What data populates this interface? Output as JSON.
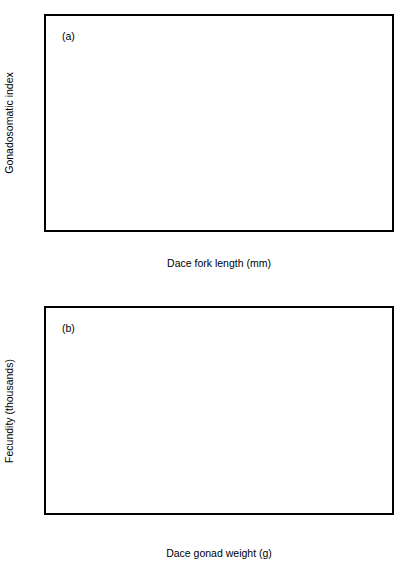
{
  "figure": {
    "background": "#ffffff",
    "foreground": "#000000",
    "marker_color": "#000000",
    "marker_symbol": "triangle-up",
    "panel_count": 2
  },
  "chart_data": [
    {
      "type": "scatter",
      "panel_label": "(a)",
      "title": "",
      "xlabel": "Dace fork length (mm)",
      "ylabel": "Gonadosomatic index",
      "xlim": [
        150,
        250
      ],
      "ylim": [
        0,
        0.4
      ],
      "xticks": [
        150,
        170,
        190,
        210,
        230,
        250
      ],
      "xticklabels": [
        "150",
        "170",
        "190",
        "210",
        "230",
        "250"
      ],
      "yticks": [
        0,
        0.1,
        0.2,
        0.3,
        0.4
      ],
      "yticklabels": [
        "0",
        "0.1",
        "0.2",
        "0.3",
        "0.4"
      ],
      "grid": false,
      "legend": null,
      "marker": "triangle-up",
      "marker_color": "#000000",
      "fit": {
        "kind": "linear",
        "label": "regression line",
        "x": [
          150,
          247
        ],
        "y": [
          0.167,
          0.355
        ]
      },
      "points": [
        {
          "x": 155.0,
          "y": 0.17
        },
        {
          "x": 160.5,
          "y": 0.207
        },
        {
          "x": 161.0,
          "y": 0.224
        },
        {
          "x": 161.5,
          "y": 0.182
        },
        {
          "x": 162.0,
          "y": 0.184
        },
        {
          "x": 163.0,
          "y": 0.21
        },
        {
          "x": 164.5,
          "y": 0.19
        },
        {
          "x": 165.0,
          "y": 0.193
        },
        {
          "x": 165.5,
          "y": 0.172
        },
        {
          "x": 166.5,
          "y": 0.191
        },
        {
          "x": 167.5,
          "y": 0.196
        },
        {
          "x": 168.0,
          "y": 0.173
        },
        {
          "x": 168.5,
          "y": 0.203
        },
        {
          "x": 169.5,
          "y": 0.205
        },
        {
          "x": 170.0,
          "y": 0.097
        },
        {
          "x": 170.3,
          "y": 0.15
        },
        {
          "x": 170.8,
          "y": 0.177
        },
        {
          "x": 171.0,
          "y": 0.212
        },
        {
          "x": 171.5,
          "y": 0.216
        },
        {
          "x": 172.0,
          "y": 0.219
        },
        {
          "x": 172.5,
          "y": 0.222
        },
        {
          "x": 173.0,
          "y": 0.213
        },
        {
          "x": 174.5,
          "y": 0.205
        },
        {
          "x": 175.0,
          "y": 0.218
        },
        {
          "x": 175.5,
          "y": 0.177
        },
        {
          "x": 176.0,
          "y": 0.175
        },
        {
          "x": 176.5,
          "y": 0.2
        },
        {
          "x": 177.0,
          "y": 0.168
        },
        {
          "x": 178.0,
          "y": 0.258
        },
        {
          "x": 178.3,
          "y": 0.265
        },
        {
          "x": 178.6,
          "y": 0.248
        },
        {
          "x": 179.0,
          "y": 0.203
        },
        {
          "x": 180.5,
          "y": 0.235
        },
        {
          "x": 181.0,
          "y": 0.213
        },
        {
          "x": 182.0,
          "y": 0.189
        },
        {
          "x": 183.5,
          "y": 0.288
        },
        {
          "x": 184.0,
          "y": 0.217
        },
        {
          "x": 185.0,
          "y": 0.21
        },
        {
          "x": 186.0,
          "y": 0.231
        },
        {
          "x": 186.5,
          "y": 0.244
        },
        {
          "x": 187.5,
          "y": 0.287
        },
        {
          "x": 188.5,
          "y": 0.289
        },
        {
          "x": 189.0,
          "y": 0.237
        },
        {
          "x": 191.5,
          "y": 0.221
        },
        {
          "x": 192.0,
          "y": 0.192
        },
        {
          "x": 192.5,
          "y": 0.253
        },
        {
          "x": 193.5,
          "y": 0.222
        },
        {
          "x": 194.0,
          "y": 0.294
        },
        {
          "x": 195.5,
          "y": 0.258
        },
        {
          "x": 203.0,
          "y": 0.39
        },
        {
          "x": 203.5,
          "y": 0.244
        },
        {
          "x": 204.0,
          "y": 0.277
        },
        {
          "x": 211.5,
          "y": 0.268
        },
        {
          "x": 215.5,
          "y": 0.272
        },
        {
          "x": 221.0,
          "y": 0.35
        },
        {
          "x": 229.0,
          "y": 0.274
        },
        {
          "x": 230.0,
          "y": 0.356
        },
        {
          "x": 231.5,
          "y": 0.274
        },
        {
          "x": 234.0,
          "y": 0.302
        },
        {
          "x": 235.5,
          "y": 0.28
        },
        {
          "x": 242.5,
          "y": 0.371
        },
        {
          "x": 246.0,
          "y": 0.336
        }
      ]
    },
    {
      "type": "scatter",
      "panel_label": "(b)",
      "title": "",
      "xlabel": "Dace gonad weight (g)",
      "ylabel": "Fecundity (thousands)",
      "xlim": [
        0,
        60
      ],
      "ylim": [
        0,
        16
      ],
      "xticks": [
        0,
        10,
        20,
        30,
        40,
        50,
        60
      ],
      "xticklabels": [
        "0",
        "10",
        "20",
        "30",
        "40",
        "50",
        "60"
      ],
      "yticks": [
        0,
        4,
        8,
        12,
        16
      ],
      "yticklabels": [
        "0",
        "4",
        "8",
        "12",
        "16"
      ],
      "grid": false,
      "legend": null,
      "marker": "triangle-up",
      "marker_color": "#000000",
      "fit": {
        "kind": "asymptotic",
        "label": "fitted curve",
        "equation": "y = 14.45 * (1 - exp(-x/18.2))",
        "asymptote": 14.45,
        "rate": 18.2,
        "x_range": [
          0,
          60
        ]
      },
      "points": [
        {
          "x": 4.6,
          "y": 2.25
        },
        {
          "x": 6.3,
          "y": 3.0
        },
        {
          "x": 7.4,
          "y": 3.45
        },
        {
          "x": 7.8,
          "y": 3.55
        },
        {
          "x": 8.0,
          "y": 3.7
        },
        {
          "x": 8.2,
          "y": 3.52
        },
        {
          "x": 8.4,
          "y": 4.05
        },
        {
          "x": 8.6,
          "y": 3.8
        },
        {
          "x": 8.8,
          "y": 4.2
        },
        {
          "x": 9.0,
          "y": 3.95
        },
        {
          "x": 9.1,
          "y": 4.35
        },
        {
          "x": 9.2,
          "y": 4.1
        },
        {
          "x": 9.4,
          "y": 4.45
        },
        {
          "x": 9.5,
          "y": 5.1
        },
        {
          "x": 9.7,
          "y": 4.3
        },
        {
          "x": 9.9,
          "y": 4.55
        },
        {
          "x": 10.1,
          "y": 4.25
        },
        {
          "x": 10.3,
          "y": 4.8
        },
        {
          "x": 10.5,
          "y": 4.4
        },
        {
          "x": 10.7,
          "y": 5.05
        },
        {
          "x": 10.9,
          "y": 4.65
        },
        {
          "x": 11.1,
          "y": 5.2
        },
        {
          "x": 11.3,
          "y": 4.5
        },
        {
          "x": 11.5,
          "y": 5.4
        },
        {
          "x": 11.8,
          "y": 4.95
        },
        {
          "x": 12.0,
          "y": 5.6
        },
        {
          "x": 12.3,
          "y": 5.3
        },
        {
          "x": 12.6,
          "y": 6.05
        },
        {
          "x": 12.9,
          "y": 5.55
        },
        {
          "x": 13.2,
          "y": 6.35
        },
        {
          "x": 13.4,
          "y": 5.85
        },
        {
          "x": 13.6,
          "y": 6.6
        },
        {
          "x": 13.9,
          "y": 5.25
        },
        {
          "x": 14.2,
          "y": 6.15
        },
        {
          "x": 14.5,
          "y": 5.95
        },
        {
          "x": 14.8,
          "y": 6.75
        },
        {
          "x": 15.0,
          "y": 7.45
        },
        {
          "x": 15.2,
          "y": 7.2
        },
        {
          "x": 15.4,
          "y": 6.5
        },
        {
          "x": 15.6,
          "y": 5.75
        },
        {
          "x": 15.9,
          "y": 6.9
        },
        {
          "x": 16.4,
          "y": 6.95
        },
        {
          "x": 17.0,
          "y": 6.6
        },
        {
          "x": 18.0,
          "y": 7.05
        },
        {
          "x": 18.6,
          "y": 7.15
        },
        {
          "x": 19.2,
          "y": 8.35
        },
        {
          "x": 19.6,
          "y": 8.6
        },
        {
          "x": 19.9,
          "y": 8.4
        },
        {
          "x": 20.4,
          "y": 8.2
        },
        {
          "x": 21.6,
          "y": 8.8
        },
        {
          "x": 22.3,
          "y": 9.0
        },
        {
          "x": 23.2,
          "y": 9.35
        },
        {
          "x": 25.2,
          "y": 10.85
        },
        {
          "x": 27.4,
          "y": 11.5
        },
        {
          "x": 32.3,
          "y": 15.05
        },
        {
          "x": 32.8,
          "y": 10.0
        },
        {
          "x": 34.5,
          "y": 10.9
        },
        {
          "x": 37.8,
          "y": 11.35
        },
        {
          "x": 38.0,
          "y": 12.75
        },
        {
          "x": 38.8,
          "y": 12.0
        },
        {
          "x": 43.4,
          "y": 12.45
        },
        {
          "x": 50.3,
          "y": 14.3
        },
        {
          "x": 52.8,
          "y": 14.95
        }
      ]
    }
  ]
}
